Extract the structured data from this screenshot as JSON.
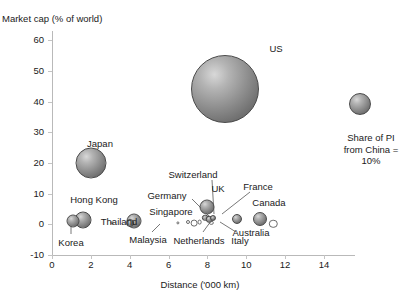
{
  "chart_data": {
    "type": "scatter",
    "title": "",
    "xlabel": "Distance ('000 km)",
    "ylabel": "Market cap (% of world)",
    "xlim": [
      0,
      15.6
    ],
    "ylim": [
      -10,
      63
    ],
    "xticks": [
      0,
      2,
      4,
      6,
      8,
      10,
      12,
      14
    ],
    "xtick_labels": [
      "0",
      "2",
      "4",
      "6",
      "8",
      "10",
      "12",
      "14"
    ],
    "yticks": [
      -10,
      0,
      10,
      20,
      30,
      40,
      50,
      60
    ],
    "ytick_labels": [
      "-10",
      "0",
      "10",
      "20",
      "30",
      "40",
      "50",
      "60"
    ],
    "grid": false,
    "legend_position": "right",
    "size_legend": {
      "text_lines": [
        "Share of PI",
        "from China =",
        "10%"
      ],
      "value": 10,
      "marker": "bubble"
    },
    "points": [
      {
        "name": "US",
        "x": 8.9,
        "y": 44.0,
        "size": 34.0,
        "marker": "bubble"
      },
      {
        "name": "Japan",
        "x": 2.0,
        "y": 20.0,
        "size": 15.5,
        "marker": "bubble"
      },
      {
        "name": "Hong Kong",
        "x": 1.6,
        "y": 1.5,
        "size": 8.5,
        "marker": "bubble"
      },
      {
        "name": "Korea",
        "x": 1.1,
        "y": 1.0,
        "size": 6.5,
        "marker": "bubble"
      },
      {
        "name": "Singapore",
        "x": 4.2,
        "y": 1.0,
        "size": 7.5,
        "marker": "bubble"
      },
      {
        "name": "Malaysia",
        "x": 4.0,
        "y": 0.5,
        "size": 4.0,
        "marker": "bubble"
      },
      {
        "name": "Thailand",
        "x": 3.1,
        "y": 0.5,
        "size": 1.6,
        "marker": "hollow"
      },
      {
        "name": "UK",
        "x": 8.0,
        "y": 5.5,
        "size": 7.5,
        "marker": "bubble"
      },
      {
        "name": "Switzerland",
        "x": 7.9,
        "y": 2.2,
        "size": 3.2,
        "marker": "bubble"
      },
      {
        "name": "Germany",
        "x": 8.1,
        "y": 1.6,
        "size": 3.2,
        "marker": "bubble"
      },
      {
        "name": "France",
        "x": 8.3,
        "y": 2.0,
        "size": 3.0,
        "marker": "bubble"
      },
      {
        "name": "Netherlands",
        "x": 7.6,
        "y": 0.6,
        "size": 2.4,
        "marker": "hollow"
      },
      {
        "name": "Italy",
        "x": 8.2,
        "y": 0.4,
        "size": 2.2,
        "marker": "hollow"
      },
      {
        "name": "Canada",
        "x": 10.7,
        "y": 1.8,
        "size": 7.0,
        "marker": "bubble"
      },
      {
        "name": "Australia",
        "x": 9.5,
        "y": 1.6,
        "size": 5.0,
        "marker": "bubble"
      },
      {
        "name": "Australia-2",
        "x": 11.4,
        "y": 0.2,
        "size": 4.2,
        "marker": "hollow"
      },
      {
        "name": "Other-1",
        "x": 6.5,
        "y": 0.4,
        "size": 1.6,
        "marker": "hollow"
      },
      {
        "name": "Other-2",
        "x": 7.0,
        "y": 0.6,
        "size": 2.0,
        "marker": "hollow"
      },
      {
        "name": "Other-3",
        "x": 7.3,
        "y": 0.5,
        "size": 3.4,
        "marker": "hollow"
      }
    ],
    "annotations": [
      {
        "label": "US",
        "lx": 276,
        "ly": 48,
        "leader": null
      },
      {
        "label": "Japan",
        "lx": 100,
        "ly": 143,
        "leader": null
      },
      {
        "label": "Hong Kong",
        "lx": 94,
        "ly": 199,
        "leader": null
      },
      {
        "label": "Korea",
        "lx": 71,
        "ly": 242,
        "leader": [
          [
            71,
            234
          ],
          [
            71,
            224
          ]
        ]
      },
      {
        "label": "Singapore",
        "lx": 171,
        "ly": 211,
        "leader": null
      },
      {
        "label": "Malaysia",
        "lx": 148,
        "ly": 239,
        "leader": [
          [
            152,
            232
          ],
          [
            160,
            224
          ]
        ]
      },
      {
        "label": "Thailand",
        "lx": 119,
        "ly": 221,
        "leader": null
      },
      {
        "label": "Germany",
        "lx": 167,
        "ly": 195,
        "leader": [
          [
            192,
            199
          ],
          [
            210,
            217
          ]
        ]
      },
      {
        "label": "Switzerland",
        "lx": 193,
        "ly": 174,
        "leader": [
          [
            212,
            180
          ],
          [
            214,
            214
          ]
        ]
      },
      {
        "label": "UK",
        "lx": 218,
        "ly": 188,
        "leader": null
      },
      {
        "label": "France",
        "lx": 258,
        "ly": 186,
        "leader": [
          [
            250,
            192
          ],
          [
            222,
            214
          ]
        ]
      },
      {
        "label": "Canada",
        "lx": 269,
        "ly": 202,
        "leader": null
      },
      {
        "label": "Netherlands",
        "lx": 199,
        "ly": 240,
        "leader": [
          [
            203,
            232
          ],
          [
            211,
            221
          ]
        ]
      },
      {
        "label": "Italy",
        "lx": 240,
        "ly": 240,
        "leader": [
          [
            236,
            232
          ],
          [
            220,
            222
          ]
        ]
      },
      {
        "label": "Australia",
        "lx": 251,
        "ly": 232,
        "leader": null
      }
    ]
  }
}
